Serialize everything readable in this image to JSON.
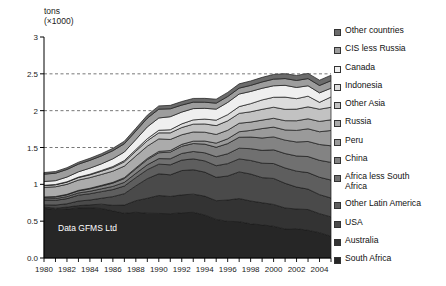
{
  "chart_data": {
    "type": "area",
    "stacked": true,
    "title": "",
    "xlabel": "",
    "ylabel": "tons (×1000)",
    "ylabel_line1": "tons",
    "ylabel_line2": "(×1000)",
    "annotation": "Data GFMS Ltd",
    "xlim": [
      1980,
      2005
    ],
    "ylim": [
      0,
      3
    ],
    "yticks": [
      "0.0",
      "0.5",
      "1",
      "1.5",
      "2",
      "2.5",
      "3"
    ],
    "ytick_values": [
      0,
      0.5,
      1,
      1.5,
      2,
      2.5,
      3
    ],
    "gridlines_dashed_at": [
      1.5,
      2,
      2.5
    ],
    "grid": "dashed-horizontal",
    "legend_position": "right",
    "xticks": [
      "1980",
      "1982",
      "1984",
      "1986",
      "1988",
      "1990",
      "1992",
      "1994",
      "1996",
      "1998",
      "2000",
      "2002",
      "2004"
    ],
    "xtick_values": [
      1980,
      1982,
      1984,
      1986,
      1988,
      1990,
      1992,
      1994,
      1996,
      1998,
      2000,
      2002,
      2004
    ],
    "x": [
      1980,
      1981,
      1982,
      1983,
      1984,
      1985,
      1986,
      1987,
      1988,
      1989,
      1990,
      1991,
      1992,
      1993,
      1994,
      1995,
      1996,
      1997,
      1998,
      1999,
      2000,
      2001,
      2002,
      2003,
      2004,
      2005
    ],
    "series": [
      {
        "name": "South Africa",
        "color": "#262626",
        "values": [
          0.675,
          0.658,
          0.664,
          0.68,
          0.683,
          0.672,
          0.64,
          0.607,
          0.621,
          0.608,
          0.605,
          0.601,
          0.614,
          0.62,
          0.584,
          0.524,
          0.498,
          0.493,
          0.464,
          0.45,
          0.431,
          0.394,
          0.399,
          0.376,
          0.344,
          0.295
        ]
      },
      {
        "name": "Australia",
        "color": "#333333",
        "values": [
          0.017,
          0.018,
          0.027,
          0.031,
          0.039,
          0.059,
          0.075,
          0.111,
          0.157,
          0.203,
          0.244,
          0.234,
          0.243,
          0.247,
          0.256,
          0.254,
          0.289,
          0.314,
          0.31,
          0.3,
          0.296,
          0.285,
          0.266,
          0.282,
          0.258,
          0.263
        ]
      },
      {
        "name": "USA",
        "color": "#4a4a4a",
        "values": [
          0.03,
          0.043,
          0.045,
          0.062,
          0.065,
          0.08,
          0.118,
          0.155,
          0.201,
          0.266,
          0.294,
          0.294,
          0.33,
          0.331,
          0.326,
          0.317,
          0.326,
          0.362,
          0.366,
          0.341,
          0.353,
          0.335,
          0.298,
          0.277,
          0.258,
          0.256
        ]
      },
      {
        "name": "Other Latin America",
        "color": "#5e5e5e",
        "values": [
          0.06,
          0.064,
          0.07,
          0.08,
          0.085,
          0.09,
          0.096,
          0.104,
          0.112,
          0.122,
          0.131,
          0.136,
          0.142,
          0.148,
          0.152,
          0.158,
          0.168,
          0.176,
          0.184,
          0.196,
          0.202,
          0.208,
          0.216,
          0.224,
          0.236,
          0.244
        ]
      },
      {
        "name": "Africa less South Africa",
        "color": "#707070",
        "values": [
          0.022,
          0.024,
          0.027,
          0.03,
          0.034,
          0.038,
          0.043,
          0.05,
          0.058,
          0.066,
          0.075,
          0.082,
          0.09,
          0.1,
          0.11,
          0.122,
          0.134,
          0.146,
          0.16,
          0.174,
          0.186,
          0.196,
          0.206,
          0.218,
          0.23,
          0.24
        ]
      },
      {
        "name": "China",
        "color": "#838383",
        "values": [
          0.02,
          0.022,
          0.025,
          0.028,
          0.033,
          0.038,
          0.045,
          0.052,
          0.06,
          0.07,
          0.08,
          0.09,
          0.098,
          0.108,
          0.118,
          0.128,
          0.138,
          0.148,
          0.158,
          0.168,
          0.176,
          0.182,
          0.19,
          0.205,
          0.215,
          0.225
        ]
      },
      {
        "name": "Peru",
        "color": "#9a9a9a",
        "values": [
          0.005,
          0.005,
          0.006,
          0.007,
          0.008,
          0.009,
          0.01,
          0.012,
          0.014,
          0.016,
          0.018,
          0.022,
          0.026,
          0.032,
          0.042,
          0.056,
          0.065,
          0.075,
          0.09,
          0.128,
          0.133,
          0.138,
          0.157,
          0.172,
          0.173,
          0.208
        ]
      },
      {
        "name": "Russia",
        "color": "#ababab",
        "values": [
          0.13,
          0.133,
          0.136,
          0.14,
          0.144,
          0.148,
          0.152,
          0.157,
          0.162,
          0.167,
          0.17,
          0.15,
          0.13,
          0.125,
          0.12,
          0.118,
          0.116,
          0.115,
          0.113,
          0.115,
          0.12,
          0.126,
          0.131,
          0.136,
          0.14,
          0.145
        ]
      },
      {
        "name": "Other Asia",
        "color": "#c2c2c2",
        "values": [
          0.025,
          0.027,
          0.03,
          0.034,
          0.038,
          0.044,
          0.05,
          0.058,
          0.066,
          0.074,
          0.082,
          0.09,
          0.098,
          0.106,
          0.112,
          0.12,
          0.128,
          0.134,
          0.14,
          0.146,
          0.15,
          0.154,
          0.158,
          0.162,
          0.166,
          0.17
        ]
      },
      {
        "name": "Indonesia",
        "color": "#dcdcdc",
        "values": [
          0.003,
          0.004,
          0.005,
          0.006,
          0.008,
          0.01,
          0.013,
          0.017,
          0.022,
          0.028,
          0.035,
          0.042,
          0.05,
          0.058,
          0.066,
          0.074,
          0.084,
          0.092,
          0.11,
          0.128,
          0.135,
          0.166,
          0.142,
          0.145,
          0.093,
          0.14
        ]
      },
      {
        "name": "Canada",
        "color": "#efefef",
        "values": [
          0.051,
          0.052,
          0.064,
          0.072,
          0.083,
          0.09,
          0.105,
          0.116,
          0.135,
          0.16,
          0.167,
          0.177,
          0.16,
          0.153,
          0.146,
          0.15,
          0.166,
          0.171,
          0.166,
          0.158,
          0.156,
          0.16,
          0.152,
          0.141,
          0.129,
          0.119
        ]
      },
      {
        "name": "CIS less Russia",
        "color": "#9d9d9d",
        "values": [
          0.1,
          0.101,
          0.103,
          0.104,
          0.106,
          0.108,
          0.11,
          0.112,
          0.115,
          0.118,
          0.12,
          0.108,
          0.095,
          0.088,
          0.083,
          0.081,
          0.08,
          0.08,
          0.082,
          0.086,
          0.09,
          0.092,
          0.095,
          0.098,
          0.1,
          0.102
        ]
      },
      {
        "name": "Other countries",
        "color": "#6b6b6b",
        "values": [
          0.022,
          0.023,
          0.024,
          0.026,
          0.028,
          0.03,
          0.032,
          0.035,
          0.038,
          0.041,
          0.044,
          0.046,
          0.048,
          0.05,
          0.052,
          0.054,
          0.056,
          0.058,
          0.06,
          0.062,
          0.064,
          0.066,
          0.068,
          0.07,
          0.072,
          0.074
        ]
      }
    ]
  },
  "legend": {
    "items": [
      {
        "label": "Other countries",
        "color": "#6b6b6b"
      },
      {
        "label": "CIS less Russia",
        "color": "#9d9d9d"
      },
      {
        "label": "Canada",
        "color": "#efefef"
      },
      {
        "label": "Indonesia",
        "color": "#dcdcdc"
      },
      {
        "label": "Other Asia",
        "color": "#c2c2c2"
      },
      {
        "label": "Russia",
        "color": "#ababab"
      },
      {
        "label": "Peru",
        "color": "#9a9a9a"
      },
      {
        "label": "China",
        "color": "#838383"
      },
      {
        "label": "Africa less South\nAfrica",
        "color": "#707070"
      },
      {
        "label": "Other Latin America",
        "color": "#5e5e5e"
      },
      {
        "label": "USA",
        "color": "#4a4a4a"
      },
      {
        "label": "Australia",
        "color": "#333333"
      },
      {
        "label": "South Africa",
        "color": "#262626"
      }
    ]
  }
}
